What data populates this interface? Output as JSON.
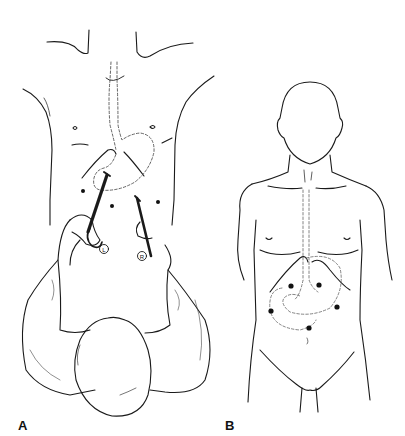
{
  "figure": {
    "panels": [
      {
        "label": "A",
        "description": "Surgeon's overhead view standing at patient's head, holding two laparoscopic instruments inserted through upper abdominal ports; esophagus and stomach outlined dashed",
        "instrument_markers": [
          "L",
          "R"
        ]
      },
      {
        "label": "B",
        "description": "Anterior view of patient torso showing five port sites (dots) over the upper abdomen with esophagus and stomach outlined dashed",
        "port_count": 5
      }
    ]
  },
  "colors": {
    "line": "#1a1a1a",
    "dashed": "#555555",
    "background": "#ffffff"
  }
}
